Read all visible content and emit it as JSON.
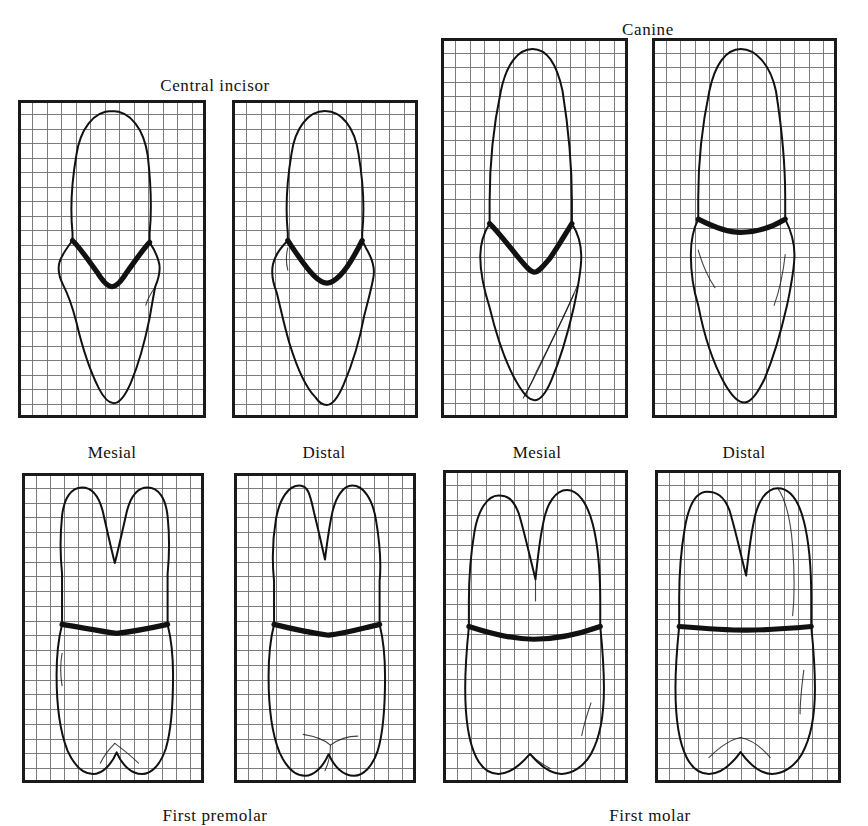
{
  "figure": {
    "kind": "dental-anatomy-plate",
    "background_color": "#ffffff",
    "ink_color": "#111111",
    "grid_line_color": "#555555",
    "grid_border_color": "#1a1a1a"
  },
  "group_titles": [
    {
      "id": "central-incisor",
      "label": "Central incisor",
      "x": 215,
      "y": 76
    },
    {
      "id": "canine",
      "label": "Canine",
      "x": 648,
      "y": 20
    },
    {
      "id": "first-premolar",
      "label": "First premolar",
      "x": 215,
      "y": 806
    },
    {
      "id": "first-molar",
      "label": "First molar",
      "x": 650,
      "y": 806
    }
  ],
  "view_labels": [
    {
      "id": "central-incisor-mesial",
      "label": "Mesial",
      "x": 112,
      "y": 443
    },
    {
      "id": "central-incisor-distal",
      "label": "Distal",
      "x": 324,
      "y": 443
    },
    {
      "id": "canine-mesial",
      "label": "Mesial",
      "x": 537,
      "y": 443
    },
    {
      "id": "canine-distal",
      "label": "Distal",
      "x": 744,
      "y": 443
    }
  ],
  "panels": [
    {
      "id": "central-incisor-mesial",
      "tooth": "Central incisor",
      "view": "Mesial",
      "x": 18,
      "y": 100,
      "w": 188,
      "h": 318,
      "grid_cols": 13,
      "grid_rows": 22,
      "cej_curvature": "deep V",
      "root_count": 1
    },
    {
      "id": "central-incisor-distal",
      "tooth": "Central incisor",
      "view": "Distal",
      "x": 232,
      "y": 100,
      "w": 186,
      "h": 318,
      "grid_cols": 13,
      "grid_rows": 22,
      "cej_curvature": "shallow U",
      "root_count": 1
    },
    {
      "id": "canine-mesial",
      "tooth": "Canine",
      "view": "Mesial",
      "x": 441,
      "y": 38,
      "w": 187,
      "h": 380,
      "grid_cols": 13,
      "grid_rows": 26,
      "cej_curvature": "deep V",
      "root_count": 1
    },
    {
      "id": "canine-distal",
      "tooth": "Canine",
      "view": "Distal",
      "x": 652,
      "y": 38,
      "w": 185,
      "h": 380,
      "grid_cols": 13,
      "grid_rows": 26,
      "cej_curvature": "shallow",
      "root_count": 1
    },
    {
      "id": "first-premolar-mesial",
      "tooth": "First premolar",
      "view": "Mesial",
      "x": 22,
      "y": 473,
      "w": 182,
      "h": 310,
      "grid_cols": 13,
      "grid_rows": 21,
      "cej_curvature": "nearly flat",
      "root_count": 2
    },
    {
      "id": "first-premolar-distal",
      "tooth": "First premolar",
      "view": "Distal",
      "x": 234,
      "y": 473,
      "w": 182,
      "h": 310,
      "grid_cols": 13,
      "grid_rows": 21,
      "cej_curvature": "nearly flat",
      "root_count": 2
    },
    {
      "id": "first-molar-mesial",
      "tooth": "First molar",
      "view": "Mesial",
      "x": 443,
      "y": 470,
      "w": 185,
      "h": 313,
      "grid_cols": 13,
      "grid_rows": 21,
      "cej_curvature": "shallow curve",
      "root_count": 2
    },
    {
      "id": "first-molar-distal",
      "tooth": "First molar",
      "view": "Distal",
      "x": 655,
      "y": 470,
      "w": 186,
      "h": 313,
      "grid_cols": 13,
      "grid_rows": 21,
      "cej_curvature": "flat",
      "root_count": 2
    }
  ]
}
